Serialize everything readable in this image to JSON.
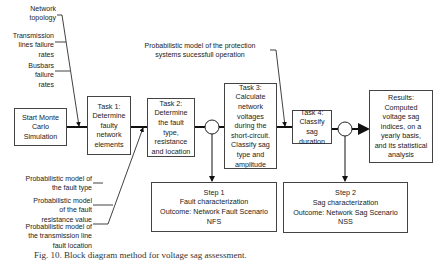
{
  "inputs_top_left": [
    {
      "id": "network-topology",
      "text": "Network\ntopology"
    },
    {
      "id": "transmission-failure",
      "text": "Transmission\nlines failure\nrates"
    },
    {
      "id": "busbars-failure",
      "text": "Busbars\nfailure\nrates"
    }
  ],
  "inputs_bottom_left": [
    {
      "id": "fault-type-model",
      "text": "Probabilistic model of\nthe fault type"
    },
    {
      "id": "fault-resistance-model",
      "text": "Probabilistic model\nof the fault\nresistance value"
    },
    {
      "id": "fault-location-model",
      "text": "Probabilistic model of\nthe transmission line\nfault location"
    }
  ],
  "protection_input": "Probabilistic model of the protection\nsystems sucessfull operation",
  "boxes": {
    "start": "Start Monte\nCarlo\nSimulation",
    "task1": "Task 1:\nDetermine\nfaulty\nnetwork\nelements",
    "task2": "Task 2:\nDetermine\nthe fault\ntype,\nresistance\nand location",
    "task3": "Task 3:\nCalculate\nnetwork\nvoltages\nduring the\nshort-circuit.\nClassify sag\ntype and\namplitude",
    "task4": "Task 4:\nClassify sag\nduration",
    "results": "Results:\nComputed\nvoltage sag\nindices, on a\nyearly basis,\nand its statistical\nanalysis",
    "step1": "Step 1\nFault characterization\nOutcome: Network Fault Scenario\nNFS",
    "step2": "Step 2\nSag characterization\nOutcome: Network Sag Scenario\nNSS"
  },
  "caption": "Fig. 10.  Block diagram method for voltage sag assessment."
}
